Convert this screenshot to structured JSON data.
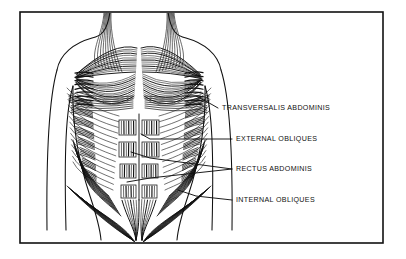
{
  "diagram": {
    "style": "black-and-white line engraving with hatched muscle striations",
    "background_color": "#ffffff",
    "ink_color": "#111111",
    "frame": {
      "name": "border-frame",
      "x": 20,
      "y": 12,
      "width": 363,
      "height": 231,
      "stroke_color": "#111111",
      "stroke_width": 1.6
    },
    "labels": [
      {
        "id": "transversalis-abdominis",
        "text": "TRANSVERSALIS ABDOMINIS",
        "text_x": 222,
        "text_y": 110,
        "leaders": [
          {
            "points": "218,108 211,104 196,96"
          }
        ]
      },
      {
        "id": "external-obliques",
        "text": "EXTERNAL OBLIQUES",
        "text_x": 236,
        "text_y": 141,
        "leaders": [
          {
            "points": "232,139 150,139 141,134"
          }
        ]
      },
      {
        "id": "rectus-abdominis",
        "text": "RECTUS ABDOMINIS",
        "text_x": 236,
        "text_y": 171,
        "leaders": [
          {
            "points": "232,169 150,158 131,152"
          },
          {
            "points": "232,169 150,178 127,182"
          }
        ]
      },
      {
        "id": "internal-obliques",
        "text": "INTERNAL OBLIQUES",
        "text_x": 236,
        "text_y": 202,
        "leaders": [
          {
            "points": "232,200 196,196 178,190"
          }
        ]
      }
    ],
    "muscle_groups": [
      {
        "id": "pectoralis-major-left",
        "name": "left pectoral fan"
      },
      {
        "id": "pectoralis-major-right",
        "name": "right pectoral fan"
      },
      {
        "id": "serratus-left",
        "name": "left serratus interdigitations"
      },
      {
        "id": "serratus-right",
        "name": "right serratus interdigitations"
      },
      {
        "id": "rectus-abdominis-block",
        "name": "six-pack rectus blocks"
      },
      {
        "id": "external-oblique-left",
        "name": "left external oblique sweep"
      },
      {
        "id": "external-oblique-right",
        "name": "right external oblique sweep"
      },
      {
        "id": "inguinal-convergence",
        "name": "lower oblique pelvic convergence"
      }
    ]
  }
}
